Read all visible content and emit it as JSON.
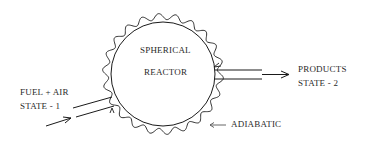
{
  "diagram": {
    "reactor": {
      "line1": "SPHERICAL",
      "line2": "REACTOR"
    },
    "inlet": {
      "line1": "FUEL  + AIR",
      "line2": "STATE  - 1"
    },
    "outlet": {
      "line1": "PRODUCTS",
      "line2": "STATE - 2"
    },
    "boundary": {
      "label": "ADIABATIC"
    },
    "colors": {
      "stroke": "#1a1a1a",
      "text": "#2a2a2a",
      "background": "#ffffff"
    }
  }
}
